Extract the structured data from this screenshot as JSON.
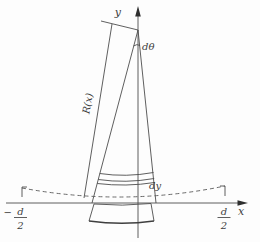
{
  "figure": {
    "name": "bent-rod-curvature-diagram",
    "colors": {
      "background": "#fdfdfd",
      "line": "#4d4d4d",
      "text": "#3d3d3d"
    },
    "labels": {
      "y_axis": "y",
      "x_axis": "x",
      "d_theta": "dθ",
      "radius": "R(x)",
      "dy": "dy",
      "left_end": {
        "sign": "−",
        "num": "d",
        "den": "2"
      },
      "right_end": {
        "num": "d",
        "den": "2"
      }
    }
  }
}
